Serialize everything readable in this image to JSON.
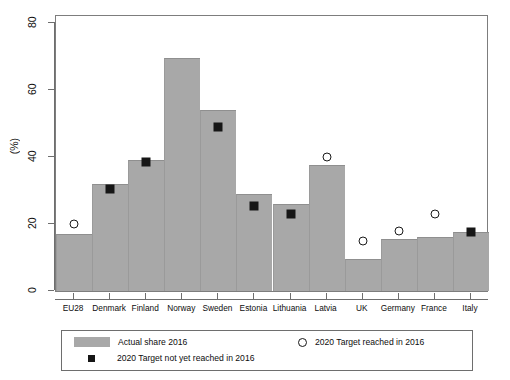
{
  "chart_data": {
    "type": "bar",
    "title": "",
    "subtitle": "",
    "xlabel": "",
    "ylabel": "(%)",
    "ylim": [
      0,
      80
    ],
    "yticks": [
      0,
      20,
      40,
      60,
      80
    ],
    "grid": false,
    "legend_position": "bottom",
    "categories": [
      "EU28",
      "Denmark",
      "Finland",
      "Norway",
      "Sweden",
      "Estonia",
      "Lithuania",
      "Latvia",
      "UK",
      "Germany",
      "France",
      "Italy"
    ],
    "series": [
      {
        "name": "Actual share 2016",
        "type": "bar",
        "color": "#a8a8a8",
        "values": [
          17,
          32,
          39,
          69.5,
          54,
          29,
          26,
          37.5,
          9.5,
          15.5,
          16,
          17.5
        ]
      },
      {
        "name": "2020 Target reached in 2016",
        "type": "scatter",
        "marker": "open-circle",
        "color": "#1a1a1a",
        "points": [
          {
            "category": "EU28",
            "value": 20
          },
          {
            "category": "Latvia",
            "value": 40
          },
          {
            "category": "UK",
            "value": 15
          },
          {
            "category": "Germany",
            "value": 18
          },
          {
            "category": "France",
            "value": 23
          }
        ]
      },
      {
        "name": "2020 Target not yet reached in 2016",
        "type": "scatter",
        "marker": "filled-square",
        "color": "#161616",
        "points": [
          {
            "category": "Denmark",
            "value": 30.5
          },
          {
            "category": "Finland",
            "value": 38.5
          },
          {
            "category": "Sweden",
            "value": 49
          },
          {
            "category": "Estonia",
            "value": 25.5
          },
          {
            "category": "Lithuania",
            "value": 23
          },
          {
            "category": "Italy",
            "value": 17.5
          }
        ]
      }
    ]
  },
  "axes": {
    "y_title": "(%)",
    "y_tick_labels": [
      "0",
      "20",
      "40",
      "60",
      "80"
    ],
    "x_tick_labels": [
      "EU28",
      "Denmark",
      "Finland",
      "Norway",
      "Sweden",
      "Estonia",
      "Lithuania",
      "Latvia",
      "UK",
      "Germany",
      "France",
      "Italy"
    ]
  },
  "legend": {
    "entries": [
      {
        "label": "Actual share 2016",
        "swatch": "bar-swatch"
      },
      {
        "label": "2020 Target not yet reached in 2016",
        "swatch": "filled-square-swatch"
      },
      {
        "label": "2020 Target reached in 2016",
        "swatch": "open-circle-swatch"
      }
    ]
  }
}
